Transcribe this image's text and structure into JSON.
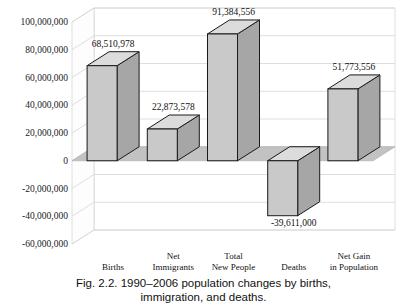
{
  "chart_data": {
    "type": "bar",
    "title": "",
    "xlabel": "",
    "ylabel": "",
    "categories": [
      "Births",
      "Net Immigrants",
      "Total New People",
      "Deaths",
      "Net Gain in Population"
    ],
    "category_lines": [
      [
        "Births"
      ],
      [
        "Net",
        "Immigrants"
      ],
      [
        "Total",
        "New People"
      ],
      [
        "Deaths"
      ],
      [
        "Net Gain",
        "in Population"
      ]
    ],
    "values": [
      68510978,
      22873578,
      91384556,
      -39611000,
      51773556
    ],
    "value_labels": [
      "68,510,978",
      "22,873,578",
      "91,384,556",
      "-39,611,000",
      "51,773,556"
    ],
    "ylim": [
      -60000000,
      100000000
    ],
    "ytick_values": [
      100000000,
      80000000,
      60000000,
      40000000,
      20000000,
      0,
      -20000000,
      -40000000,
      -60000000
    ],
    "ytick_labels": [
      "100,000,000",
      "80,000,000",
      "60,000,000",
      "40,000,000",
      "20,000,000",
      "0",
      "-20,000,000",
      "-40,000,000",
      "-60,000,000"
    ],
    "grid": true,
    "legend": "none",
    "style": "3d-column",
    "colors": {
      "bar_front": "#c9c9c9",
      "bar_side": "#a6a6a6",
      "bar_top": "#dcdcdc",
      "bar_outline": "#1a1a1a",
      "floor": "#c2c2c2",
      "wall": "#ffffff",
      "gridline": "#d6d6d6",
      "text": "#111111"
    }
  },
  "caption": {
    "line1": "Fig. 2.2. 1990–2006 population changes by births,",
    "line2": "immigration, and deaths."
  }
}
